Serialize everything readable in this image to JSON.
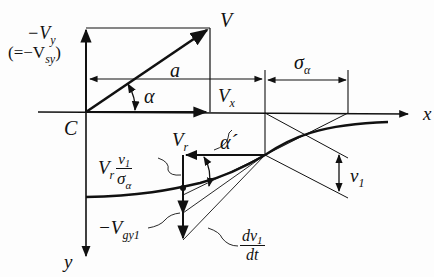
{
  "diagram": {
    "title": "",
    "labels": {
      "neg_vy": "−V",
      "neg_vy_sub": "y",
      "eq_vsy_open": "(=−V",
      "eq_vsy_sub": "sy",
      "eq_vsy_close": ")",
      "v": "V",
      "a": "a",
      "alpha": "α",
      "vx": "V",
      "vx_sub": "x",
      "sigma": "σ",
      "sigma_sub": "α",
      "x_axis": "x",
      "y_axis": "y",
      "c": "C",
      "vr": "V",
      "vr_sub": "r",
      "alpha_prime": "α´",
      "vr_frac_prefix": "V",
      "vr_frac_prefix_sub": "r",
      "vr_frac_num": "v",
      "vr_frac_num_sub": "1",
      "vr_frac_den": "σ",
      "vr_frac_den_sub": "α",
      "v1": "v",
      "v1_sub": "1",
      "neg_vgy1": "−V",
      "neg_vgy1_sub": "gy1",
      "dv1_num": "dv",
      "dv1_num_sub": "1",
      "dv1_den": "dt"
    },
    "colors": {
      "ink": "#111111",
      "background": "#fdfdfd"
    }
  }
}
